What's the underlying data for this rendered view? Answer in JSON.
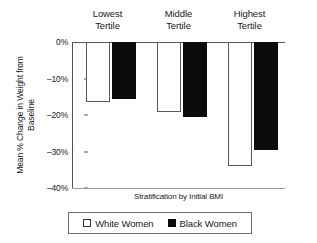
{
  "chart_data": {
    "type": "bar",
    "title": "",
    "xlabel": "Stratification by Initial BMI",
    "ylabel_line1": "Mean % Change in Weight from",
    "ylabel_line2": "Baseline",
    "categories": [
      "Lowest Tertile",
      "Middle Tertile",
      "Highest Tertile"
    ],
    "category_lines": [
      {
        "line1": "Lowest",
        "line2": "Tertile"
      },
      {
        "line1": "Middle",
        "line2": "Tertile"
      },
      {
        "line1": "Highest",
        "line2": "Tertile"
      }
    ],
    "series": [
      {
        "name": "White Women",
        "color": "#ffffff",
        "edge": "#595959",
        "values": [
          -16.5,
          -19.3,
          -34.0
        ]
      },
      {
        "name": "Black Women",
        "color": "#0b0b0b",
        "edge": "#0b0b0b",
        "values": [
          -15.7,
          -20.5,
          -29.5
        ]
      }
    ],
    "ylim": [
      -40,
      0
    ],
    "yticks": [
      0,
      -10,
      -20,
      -30,
      -40
    ],
    "ytick_labels": [
      "0%",
      "–10%",
      "–20%",
      "–30%",
      "–40%"
    ],
    "grid": false,
    "legend_position": "bottom",
    "legend_entries": [
      {
        "label": "White Women",
        "swatch": "white"
      },
      {
        "label": "Black Women",
        "swatch": "black"
      }
    ]
  }
}
